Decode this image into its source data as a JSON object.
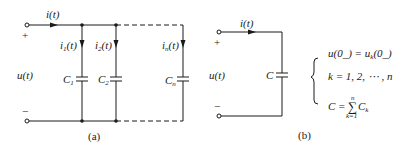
{
  "figure_a": {
    "caption": "(a)",
    "source_current": "i(t)",
    "voltage": "u(t)",
    "plus": "+",
    "minus": "−",
    "branches": [
      {
        "current_main": "i",
        "current_sub": "1",
        "current_tail": "(t)",
        "cap_main": "C",
        "cap_sub": "1"
      },
      {
        "current_main": "i",
        "current_sub": "2",
        "current_tail": "(t)",
        "cap_main": "C",
        "cap_sub": "2"
      },
      {
        "current_main": "i",
        "current_sub": "n",
        "current_tail": "(t)",
        "cap_main": "C",
        "cap_sub": "n"
      }
    ]
  },
  "figure_b": {
    "caption": "(b)",
    "source_current": "i(t)",
    "voltage": "u(t)",
    "plus": "+",
    "minus": "−",
    "cap_label": "C",
    "equations": {
      "eq1_left": "u(0",
      "eq1_mid": "_) = u",
      "eq1_sub": "k",
      "eq1_right": "(0_)",
      "eq2": "k = 1, 2, ⋯ , n",
      "eq3_left": "C = ",
      "eq3_sum": "∑",
      "eq3_top": "n",
      "eq3_bottom": "k=1",
      "eq3_term": "C",
      "eq3_sub": "k"
    }
  },
  "colors": {
    "ink": "#1a1a1a",
    "background": "#ffffff"
  }
}
